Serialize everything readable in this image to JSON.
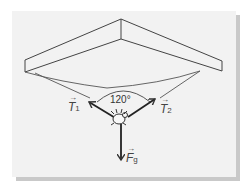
{
  "diagram": {
    "angle_label": "120°",
    "forces": [
      {
        "id": "T1",
        "symbol": "T",
        "subscript": "1",
        "label": "T1",
        "direction": "up-left"
      },
      {
        "id": "T2",
        "symbol": "T",
        "subscript": "2",
        "label": "T2",
        "direction": "up-right"
      },
      {
        "id": "Fg",
        "symbol": "F",
        "subscript": "g",
        "label": "Fg",
        "direction": "down"
      }
    ],
    "colors": {
      "panel": "#f2f2f2",
      "shadow": "#c9c9c9",
      "line": "#333333"
    }
  }
}
